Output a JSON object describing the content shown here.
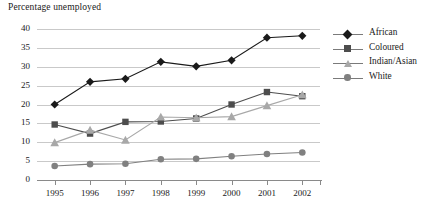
{
  "chart_data": {
    "type": "line",
    "title": "Percentage unemployed",
    "xlabel": "",
    "ylabel": "",
    "x": [
      1995,
      1996,
      1997,
      1998,
      1999,
      2000,
      2001,
      2002
    ],
    "categories": [
      "1995",
      "1996",
      "1997",
      "1998",
      "1999",
      "2000",
      "2001",
      "2002"
    ],
    "ylim": [
      0,
      40
    ],
    "yticks": [
      0,
      5,
      10,
      15,
      20,
      25,
      30,
      35,
      40
    ],
    "ytick_labels": [
      "0",
      "5",
      "10",
      "15",
      "20",
      "25",
      "30",
      "35",
      "40"
    ],
    "grid": "horizontal",
    "legend_position": "right",
    "series": [
      {
        "name": "African",
        "marker": "diamond",
        "color": "#1a1a1a",
        "values": [
          20.0,
          26.0,
          26.8,
          31.3,
          30.1,
          31.7,
          37.7,
          38.2
        ]
      },
      {
        "name": "Coloured",
        "marker": "square",
        "color": "#4d4d4d",
        "values": [
          14.7,
          12.3,
          15.4,
          15.5,
          16.3,
          20.0,
          23.3,
          22.2
        ]
      },
      {
        "name": "Indian/Asian",
        "marker": "triangle",
        "color": "#a8a8a8",
        "values": [
          9.9,
          13.2,
          10.6,
          16.7,
          16.5,
          16.8,
          19.7,
          22.6
        ]
      },
      {
        "name": "White",
        "marker": "circle",
        "color": "#808080",
        "values": [
          3.7,
          4.2,
          4.3,
          5.5,
          5.6,
          6.3,
          6.9,
          7.3
        ]
      }
    ]
  },
  "legend": {
    "items": [
      {
        "label": "African"
      },
      {
        "label": "Coloured"
      },
      {
        "label": "Indian/Asian"
      },
      {
        "label": "White"
      }
    ]
  }
}
